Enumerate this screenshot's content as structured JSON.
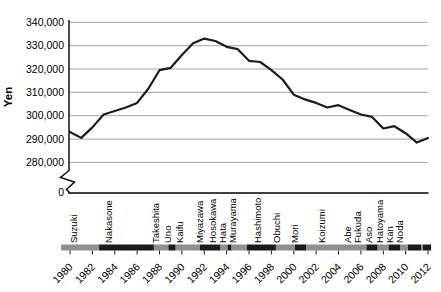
{
  "chart_data": {
    "type": "line",
    "title": "",
    "ylabel": "Yen",
    "grid": "horizontal",
    "legend": "none",
    "ylim": [
      280000,
      340000
    ],
    "y_axis_break_to_zero": true,
    "x": [
      1980,
      1981,
      1982,
      1983,
      1984,
      1985,
      1986,
      1987,
      1988,
      1989,
      1990,
      1991,
      1992,
      1993,
      1994,
      1995,
      1996,
      1997,
      1998,
      1999,
      2000,
      2001,
      2002,
      2003,
      2004,
      2005,
      2006,
      2007,
      2008,
      2009,
      2010,
      2011,
      2012
    ],
    "values": [
      293000,
      290500,
      295000,
      300500,
      302000,
      303500,
      305500,
      311500,
      319500,
      320500,
      326000,
      331000,
      333000,
      332000,
      329500,
      328500,
      323500,
      323000,
      319500,
      315500,
      309000,
      307000,
      305500,
      303500,
      304500,
      302500,
      300500,
      299500,
      294500,
      295500,
      292500,
      288500,
      290500
    ],
    "y_ticks": {
      "values": [
        340000,
        330000,
        320000,
        310000,
        300000,
        290000,
        280000,
        0
      ],
      "labels": [
        "340,000",
        "330,000",
        "320,000",
        "310,000",
        "300,000",
        "290,000",
        "280,000",
        "0"
      ]
    },
    "x_tick_years": [
      1980,
      1982,
      1984,
      1986,
      1988,
      1990,
      1992,
      1994,
      1996,
      1998,
      2000,
      2002,
      2004,
      2006,
      2008,
      2010,
      2012
    ],
    "pm_labels": [
      {
        "name": "Suzuki",
        "x": 73
      },
      {
        "name": "Nakasone",
        "x": 108
      },
      {
        "name": "Takeshita",
        "x": 155
      },
      {
        "name": "Uno",
        "x": 167
      },
      {
        "name": "Kaifu",
        "x": 179
      },
      {
        "name": "Miyazawa",
        "x": 199
      },
      {
        "name": "Hosokawa",
        "x": 212
      },
      {
        "name": "Hata",
        "x": 222
      },
      {
        "name": "Murayama",
        "x": 232
      },
      {
        "name": "Hashimoto",
        "x": 257
      },
      {
        "name": "Obuchi",
        "x": 276
      },
      {
        "name": "Mori",
        "x": 294
      },
      {
        "name": "Koizumi",
        "x": 321
      },
      {
        "name": "Abe",
        "x": 347
      },
      {
        "name": "Fukuda",
        "x": 357
      },
      {
        "name": "Aso",
        "x": 368
      },
      {
        "name": "Hatoyama",
        "x": 379
      },
      {
        "name": "Kan",
        "x": 389
      },
      {
        "name": "Noda",
        "x": 399
      }
    ],
    "pm_terms": [
      {
        "name": "Suzuki",
        "start": 1979.2,
        "end": 1982.6,
        "shade": "gray"
      },
      {
        "name": "Nakasone",
        "start": 1982.6,
        "end": 1987.5,
        "shade": "black"
      },
      {
        "name": "Takeshita",
        "start": 1987.5,
        "end": 1988.8,
        "shade": "gray"
      },
      {
        "name": "Uno",
        "start": 1988.8,
        "end": 1989.45,
        "shade": "black"
      },
      {
        "name": "Kaifu",
        "start": 1989.45,
        "end": 1991.6,
        "shade": "gray"
      },
      {
        "name": "Miyazawa",
        "start": 1991.6,
        "end": 1993.45,
        "shade": "black"
      },
      {
        "name": "Hosokawa",
        "start": 1993.45,
        "end": 1994.1,
        "shade": "gray"
      },
      {
        "name": "Hata",
        "start": 1994.1,
        "end": 1994.45,
        "shade": "black"
      },
      {
        "name": "Murayama",
        "start": 1994.45,
        "end": 1995.8,
        "shade": "gray"
      },
      {
        "name": "Hashimoto",
        "start": 1995.8,
        "end": 1998.4,
        "shade": "black"
      },
      {
        "name": "Obuchi",
        "start": 1998.4,
        "end": 2000.1,
        "shade": "gray"
      },
      {
        "name": "Mori",
        "start": 2000.1,
        "end": 2001.1,
        "shade": "black"
      },
      {
        "name": "Koizumi",
        "start": 2001.1,
        "end": 2006.5,
        "shade": "gray"
      },
      {
        "name": "Abe",
        "start": 2006.5,
        "end": 2007.5,
        "shade": "black"
      },
      {
        "name": "Fukuda",
        "start": 2007.5,
        "end": 2008.5,
        "shade": "gray"
      },
      {
        "name": "Aso",
        "start": 2008.5,
        "end": 2009.5,
        "shade": "black"
      },
      {
        "name": "Hatoyama",
        "start": 2009.5,
        "end": 2010.2,
        "shade": "gray"
      },
      {
        "name": "Kan",
        "start": 2010.2,
        "end": 2011.4,
        "shade": "black"
      },
      {
        "name": "",
        "start": 2011.4,
        "end": 2011.55,
        "shade": "gray"
      },
      {
        "name": "Noda",
        "start": 2011.55,
        "end": 2012.27,
        "shade": "black"
      }
    ],
    "colors": {
      "line": "#1c1c1c",
      "grid": "#999999",
      "axis": "#000000",
      "bar_gray": "#8f8f8f",
      "bar_black": "#1b1b1b",
      "text": "#000000"
    }
  }
}
